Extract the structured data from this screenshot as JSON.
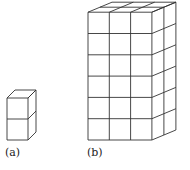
{
  "figures": [
    {
      "id": "a",
      "label": "(a)",
      "description": "Stack of 2 unit cubes",
      "grid": {
        "cols": 1,
        "rows": 2,
        "depth": 1
      }
    },
    {
      "id": "b",
      "label": "(b)",
      "description": "Rectangular prism of unit cubes",
      "grid": {
        "cols": 3,
        "rows": 6,
        "depth": 2
      }
    }
  ],
  "colors": {
    "line": "#333333",
    "background": "#ffffff"
  }
}
